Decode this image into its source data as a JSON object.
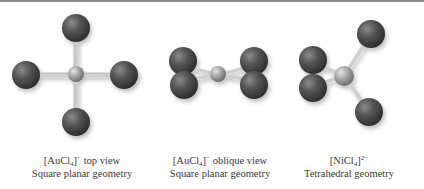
{
  "figures": [
    {
      "id": "auc14-top",
      "formula_prefix": "[AuCl",
      "formula_subscript": "4",
      "formula_bracket": "]",
      "formula_charge": "−",
      "view": " top view",
      "geometry": "Square planar geometry"
    },
    {
      "id": "auc14-oblique",
      "formula_prefix": "[AuCl",
      "formula_subscript": "4",
      "formula_bracket": "]",
      "formula_charge": "−",
      "view": " oblique view",
      "geometry": "Square planar geometry"
    },
    {
      "id": "nicl4-tetrahedral",
      "formula_prefix": "[NiCl",
      "formula_subscript": "4",
      "formula_bracket": "]",
      "formula_charge": "2−",
      "view": "",
      "geometry": "Tetrahedral geometry"
    }
  ],
  "colors": {
    "ligand_atom": "#4a4a4a",
    "central_atom": "#9a9a9a",
    "bond": "#c8c8c8",
    "caption_text": "#3a3a3a",
    "top_rule": "#8a8a8a"
  }
}
